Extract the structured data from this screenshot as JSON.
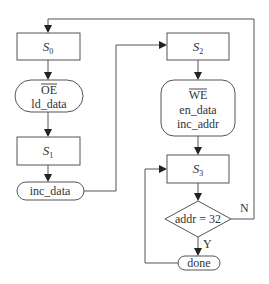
{
  "diagram": {
    "type": "flowchart",
    "nodes": {
      "s0": {
        "kind": "state",
        "label": "S",
        "subscript": "0"
      },
      "oe": {
        "kind": "action",
        "line1": "OE",
        "line1_overlined": true,
        "line2": "ld_data"
      },
      "s1": {
        "kind": "state",
        "label": "S",
        "subscript": "1"
      },
      "inc_data": {
        "kind": "action",
        "label": "inc_data"
      },
      "s2": {
        "kind": "state",
        "label": "S",
        "subscript": "2"
      },
      "we": {
        "kind": "action",
        "line1": "WE",
        "line1_overlined": true,
        "line2": "en_data",
        "line3": "inc_addr"
      },
      "s3": {
        "kind": "state",
        "label": "S",
        "subscript": "3"
      },
      "decision": {
        "kind": "decision",
        "label": "addr = 32"
      },
      "done": {
        "kind": "action",
        "label": "done"
      }
    },
    "edge_labels": {
      "no": "N",
      "yes": "Y"
    },
    "edges": [
      {
        "from": "s0",
        "to": "oe"
      },
      {
        "from": "oe",
        "to": "s1"
      },
      {
        "from": "s1",
        "to": "inc_data"
      },
      {
        "from": "inc_data",
        "to": "s2"
      },
      {
        "from": "s2",
        "to": "we"
      },
      {
        "from": "we",
        "to": "s3"
      },
      {
        "from": "s3",
        "to": "decision"
      },
      {
        "from": "decision",
        "to": "s0",
        "label": "N"
      },
      {
        "from": "decision",
        "to": "done",
        "label": "Y"
      },
      {
        "from": "done",
        "to": "s3"
      }
    ],
    "colors": {
      "stroke": "#555555",
      "text": "#333333",
      "background": "#ffffff"
    }
  }
}
